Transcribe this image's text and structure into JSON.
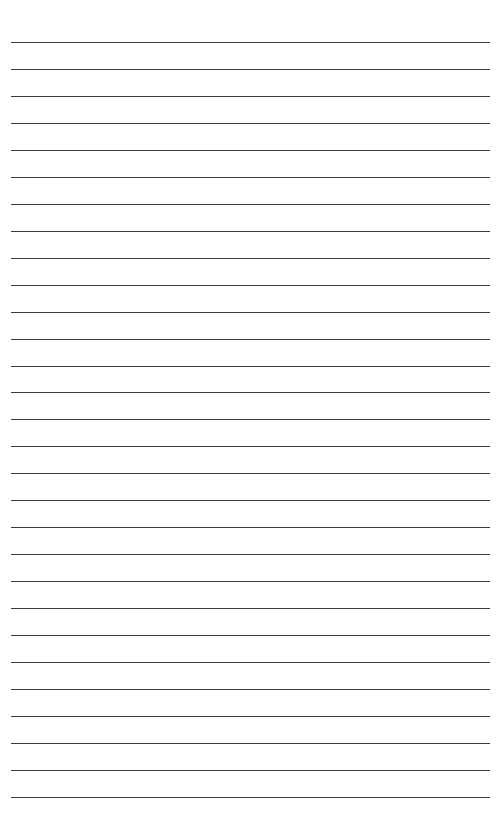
{
  "page": {
    "type": "lined-paper",
    "line_count": 29,
    "first_line_y": 42,
    "line_spacing": 26.96,
    "line_left": 11,
    "line_width": 479,
    "line_color": "#3a3a3a",
    "background_color": "#ffffff"
  }
}
